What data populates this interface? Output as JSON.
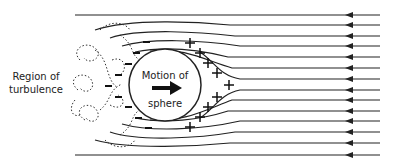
{
  "diagram": {
    "labels": {
      "region_line1": "Region of",
      "region_line2": "turbulence",
      "motion_line1": "Motion of",
      "motion_line2": "sphere"
    },
    "symbols": {
      "positive": "+",
      "negative": "−"
    },
    "flow_direction": "right-to-left",
    "motion_direction": "left-to-right",
    "streamline_count": 14,
    "colors": {
      "line": "#222222",
      "background": "#ffffff"
    }
  }
}
